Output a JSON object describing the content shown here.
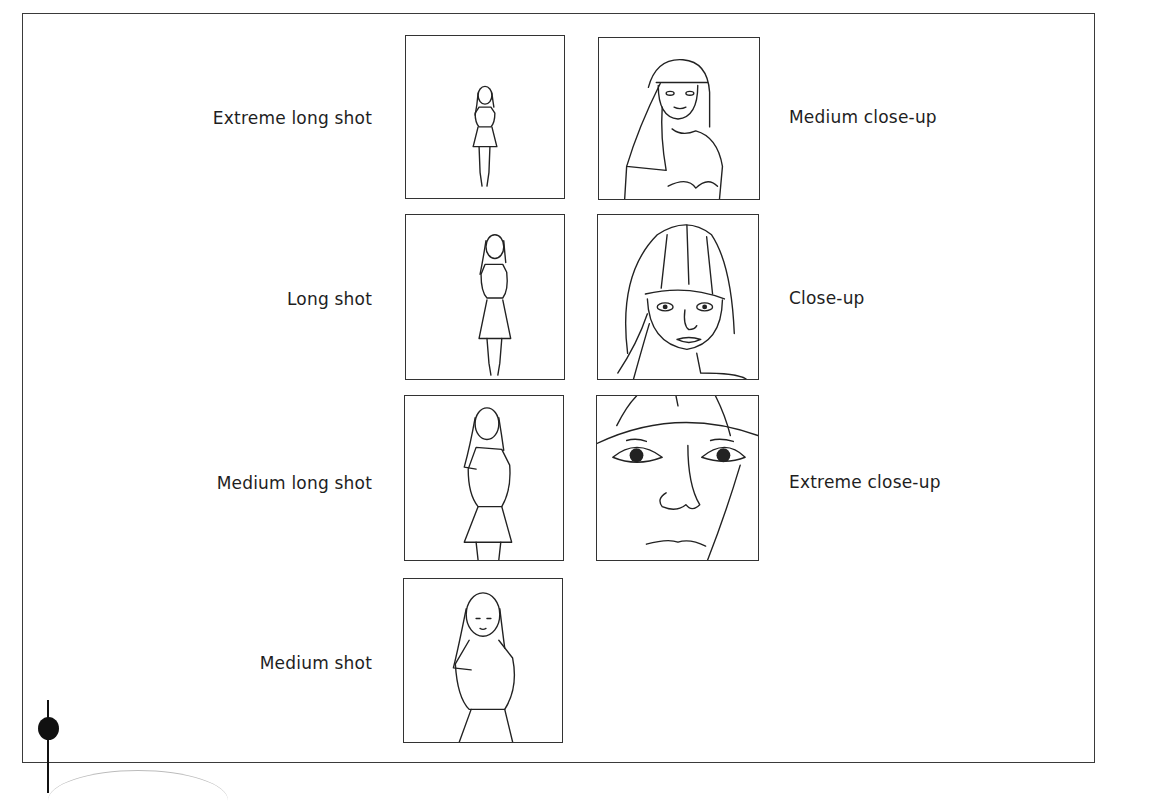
{
  "figure": {
    "shots": [
      {
        "id": "extreme-long-shot",
        "label": "Extreme long shot",
        "column": "left",
        "row": 1
      },
      {
        "id": "long-shot",
        "label": "Long shot",
        "column": "left",
        "row": 2
      },
      {
        "id": "medium-long-shot",
        "label": "Medium long shot",
        "column": "left",
        "row": 3
      },
      {
        "id": "medium-shot",
        "label": "Medium shot",
        "column": "left",
        "row": 4
      },
      {
        "id": "medium-close-up",
        "label": "Medium close-up",
        "column": "right",
        "row": 1
      },
      {
        "id": "close-up",
        "label": "Close-up",
        "column": "right",
        "row": 2
      },
      {
        "id": "extreme-close-up",
        "label": "Extreme close-up",
        "column": "right",
        "row": 3
      }
    ]
  }
}
